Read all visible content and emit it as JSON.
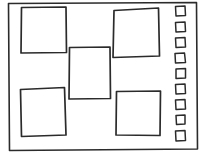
{
  "canvas": {
    "width": 204,
    "height": 158,
    "background_color": "#ffffff",
    "stroke_color": "#2b2b2b",
    "style": "hand-drawn wireframe sketch"
  },
  "frame": {
    "label": "outer page frame",
    "path": "M 8.5 3.5 L 196.5 2.5 L 197.5 149.0 L 9.5 150.5 Z"
  },
  "panels": [
    {
      "name": "panel-top-left",
      "label": "content block top left",
      "path": "M 21.5 7.5 L 66.0 7.0 L 66.5 52.5 L 21.0 53.0 Z"
    },
    {
      "name": "panel-top-right",
      "label": "content block top right",
      "path": "M 114.0 10.5 L 158.5 8.0 L 159.5 56.0 L 113.0 57.5 Z"
    },
    {
      "name": "panel-center",
      "label": "content block center",
      "path": "M 69.5 47.5 L 110.0 47.0 L 110.5 98.5 L 69.0 99.0 Z"
    },
    {
      "name": "panel-bottom-left",
      "label": "content block bottom left",
      "path": "M 20.5 89.5 L 64.5 87.5 L 66.0 135.0 L 21.5 136.5 Z"
    },
    {
      "name": "panel-bottom-right",
      "label": "content block bottom right",
      "path": "M 116.5 91.5 L 160.5 91.0 L 160.0 135.5 L 116.0 135.0 Z"
    }
  ],
  "checkbox_list": {
    "name": "checkbox-column",
    "label": "vertical checkbox list",
    "count": 9,
    "items": [
      {
        "label": "checkbox 1",
        "path": "M 175.5 6.5 L 185.0 6.0 L 185.5 15.5 L 176.0 16.0 Z"
      },
      {
        "label": "checkbox 2",
        "path": "M 175.5 22.5 L 185.0 22.0 L 185.5 31.5 L 176.0 32.0 Z"
      },
      {
        "label": "checkbox 3",
        "path": "M 175.5 38.0 L 185.0 37.5 L 185.5 47.0 L 176.0 47.5 Z"
      },
      {
        "label": "checkbox 4",
        "path": "M 175.0 53.5 L 184.5 53.0 L 185.5 62.5 L 175.5 63.0 Z"
      },
      {
        "label": "checkbox 5",
        "path": "M 176.0 69.0 L 185.5 68.5 L 185.5 78.0 L 176.0 78.5 Z"
      },
      {
        "label": "checkbox 6",
        "path": "M 175.5 84.5 L 185.0 84.0 L 185.5 93.5 L 176.0 94.0 Z"
      },
      {
        "label": "checkbox 7",
        "path": "M 175.5 100.0 L 185.0 99.5 L 185.5 109.0 L 176.0 109.5 Z"
      },
      {
        "label": "checkbox 8",
        "path": "M 176.0 115.5 L 185.0 115.0 L 185.0 124.0 L 176.5 124.5 Z"
      },
      {
        "label": "checkbox 9",
        "path": "M 175.5 131.0 L 185.0 130.5 L 185.5 140.5 L 176.0 141.0 Z"
      }
    ]
  }
}
